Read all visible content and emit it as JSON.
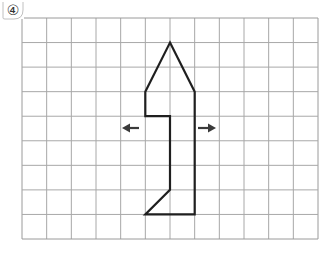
{
  "problem": {
    "number_label": "④"
  },
  "grid": {
    "columns": 12,
    "rows": 9,
    "left": 22,
    "top": 18,
    "right": 318,
    "bottom": 239,
    "line_color": "#a8a8a8",
    "border_color": "#9a9a9a"
  },
  "shape": {
    "stroke_color": "#1f1f1f",
    "points_grid": [
      [
        6,
        1
      ],
      [
        7,
        3
      ],
      [
        7,
        8
      ],
      [
        5,
        8
      ],
      [
        6,
        7
      ],
      [
        6,
        4
      ],
      [
        5,
        4
      ],
      [
        5,
        3
      ]
    ]
  },
  "arrows": [
    {
      "name": "left-arrow",
      "direction": "left",
      "x1": 139,
      "x2": 122,
      "y": 128
    },
    {
      "name": "right-arrow",
      "direction": "right",
      "x1": 198,
      "x2": 216,
      "y": 128
    }
  ],
  "colors": {
    "arrow": "#3a3a3a",
    "background": "#ffffff"
  }
}
